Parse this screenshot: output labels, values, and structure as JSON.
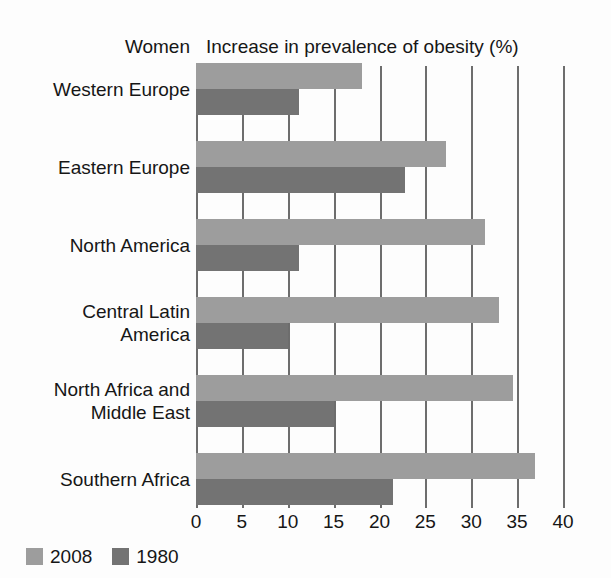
{
  "header": {
    "panel_label": "Women",
    "axis_title": "Increase in prevalence of obesity (%)"
  },
  "legend": {
    "items": [
      {
        "label": "2008",
        "color": "#9d9d9d",
        "swatch_name": "legend-swatch-2008"
      },
      {
        "label": "1980",
        "color": "#737373",
        "swatch_name": "legend-swatch-1980"
      }
    ]
  },
  "axis": {
    "ticks": [
      "0",
      "5",
      "10",
      "15",
      "20",
      "25",
      "30",
      "35",
      "40"
    ],
    "min": 0,
    "max": 40,
    "step": 5
  },
  "rows": [
    {
      "label_lines": [
        "Western Europe"
      ]
    },
    {
      "label_lines": [
        "Eastern Europe"
      ]
    },
    {
      "label_lines": [
        "North America"
      ]
    },
    {
      "label_lines": [
        "Central Latin",
        "America"
      ]
    },
    {
      "label_lines": [
        "North Africa and",
        "Middle East"
      ]
    },
    {
      "label_lines": [
        "Southern Africa"
      ]
    }
  ],
  "chart_data": {
    "type": "bar",
    "orientation": "horizontal",
    "title": "Increase in prevalence of obesity (%)",
    "subtitle": "Women",
    "xlabel": "Increase in prevalence of obesity (%)",
    "ylabel": "",
    "xlim": [
      0,
      40
    ],
    "xticks": [
      0,
      5,
      10,
      15,
      20,
      25,
      30,
      35,
      40
    ],
    "grid": true,
    "legend_position": "bottom-left",
    "categories": [
      "Western Europe",
      "Eastern Europe",
      "North America",
      "Central Latin America",
      "North Africa and Middle East",
      "Southern Africa"
    ],
    "series": [
      {
        "name": "2008",
        "color": "#9d9d9d",
        "values": [
          18.1,
          27.3,
          31.5,
          33.0,
          34.5,
          37.0
        ]
      },
      {
        "name": "1980",
        "color": "#737373",
        "values": [
          11.2,
          22.8,
          11.2,
          10.0,
          15.0,
          21.5
        ]
      }
    ]
  }
}
